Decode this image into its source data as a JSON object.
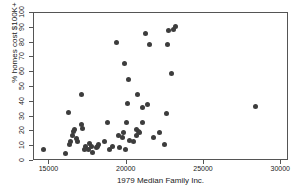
{
  "chart_data": {
    "type": "scatter",
    "title": "",
    "xlabel": "1979 Median Family Inc.",
    "ylabel": "% homes cost $100K+",
    "xlim": [
      14000,
      30500
    ],
    "ylim": [
      0,
      100
    ],
    "xticks": [
      15000,
      20000,
      25000,
      30000
    ],
    "xticklabels": [
      "15000",
      "20000",
      "25000",
      "30000"
    ],
    "yticks": [
      0,
      10,
      20,
      30,
      40,
      50,
      60,
      70,
      80,
      90,
      100
    ],
    "yticklabels": [
      "0",
      "10",
      "20",
      "30",
      "40",
      "50",
      "60",
      "70",
      "80",
      "90",
      "100"
    ],
    "grid": false,
    "legend": null,
    "marker": {
      "shape": "circle",
      "color": "#3d3d3d",
      "size_px": 5
    },
    "series": [
      {
        "name": "metro areas",
        "points": [
          [
            14600,
            8
          ],
          [
            16050,
            5
          ],
          [
            16200,
            33
          ],
          [
            16300,
            11
          ],
          [
            16350,
            13
          ],
          [
            16500,
            17
          ],
          [
            16550,
            20
          ],
          [
            16600,
            21
          ],
          [
            16750,
            15
          ],
          [
            16800,
            13
          ],
          [
            17050,
            25
          ],
          [
            17100,
            45
          ],
          [
            17150,
            22
          ],
          [
            17250,
            8
          ],
          [
            17300,
            10
          ],
          [
            17500,
            8
          ],
          [
            17600,
            12
          ],
          [
            17700,
            10
          ],
          [
            17800,
            6
          ],
          [
            18050,
            9
          ],
          [
            18100,
            10
          ],
          [
            18200,
            11
          ],
          [
            18550,
            13
          ],
          [
            18750,
            26
          ],
          [
            18900,
            8
          ],
          [
            19100,
            10
          ],
          [
            19350,
            80
          ],
          [
            19450,
            17
          ],
          [
            19500,
            9
          ],
          [
            19700,
            16
          ],
          [
            19800,
            19
          ],
          [
            19850,
            66
          ],
          [
            19950,
            8
          ],
          [
            20000,
            26
          ],
          [
            20050,
            39
          ],
          [
            20100,
            55
          ],
          [
            20200,
            14
          ],
          [
            20450,
            13
          ],
          [
            20600,
            17
          ],
          [
            20650,
            21
          ],
          [
            20700,
            45
          ],
          [
            20750,
            20
          ],
          [
            20800,
            19
          ],
          [
            21000,
            26
          ],
          [
            21050,
            36
          ],
          [
            21200,
            86
          ],
          [
            21350,
            38
          ],
          [
            21500,
            79
          ],
          [
            21750,
            16
          ],
          [
            22100,
            19
          ],
          [
            22450,
            11
          ],
          [
            22550,
            32
          ],
          [
            22650,
            79
          ],
          [
            22700,
            88
          ],
          [
            22900,
            59
          ],
          [
            23000,
            89
          ],
          [
            23150,
            91
          ],
          [
            28350,
            37
          ]
        ]
      }
    ]
  }
}
